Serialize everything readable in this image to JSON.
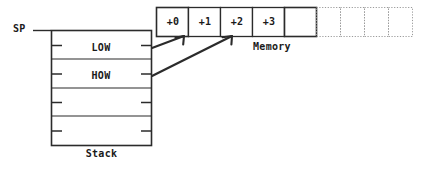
{
  "diagram": {
    "colors": {
      "ink": "#1a1a1a",
      "solid_border": "#2b2b2b",
      "dotted_border": "#9a9a9a",
      "background": "#ffffff"
    },
    "pointer": {
      "label": "SP",
      "name": "stack-pointer",
      "points_to": "stack-row-0"
    },
    "stack": {
      "caption": "Stack",
      "rows": [
        {
          "label": "LOW",
          "index": 0,
          "filled": true
        },
        {
          "label": "HOW",
          "index": 1,
          "filled": true
        },
        {
          "label": "",
          "index": 2,
          "filled": false
        },
        {
          "label": "",
          "index": 3,
          "filled": false
        }
      ]
    },
    "memory": {
      "caption": "Memory",
      "cells": [
        {
          "label": "+0",
          "style": "solid"
        },
        {
          "label": "+1",
          "style": "solid"
        },
        {
          "label": "+2",
          "style": "solid"
        },
        {
          "label": "+3",
          "style": "solid"
        },
        {
          "label": "",
          "style": "solid"
        },
        {
          "label": "",
          "style": "dotted"
        },
        {
          "label": "",
          "style": "dotted"
        },
        {
          "label": "",
          "style": "dotted"
        },
        {
          "label": "",
          "style": "dotted"
        }
      ]
    },
    "connectors": [
      {
        "name": "low-to-plus0",
        "from": "stack-row-0",
        "to": "memory-cell-0"
      },
      {
        "name": "how-to-plus2",
        "from": "stack-row-1",
        "to": "memory-cell-2"
      }
    ]
  }
}
